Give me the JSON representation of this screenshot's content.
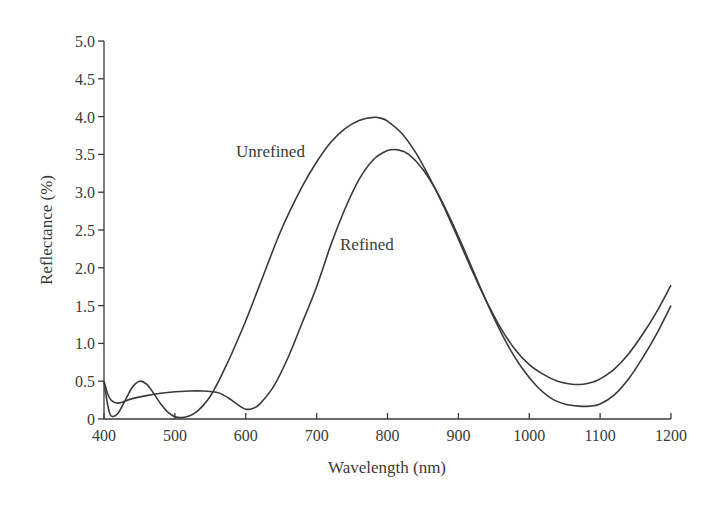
{
  "chart_data": {
    "type": "line",
    "title": "",
    "xlabel": "Wavelength (nm)",
    "ylabel": "Reflectance (%)",
    "xlim": [
      400,
      1200
    ],
    "ylim": [
      0,
      5.0
    ],
    "xticks": [
      400,
      500,
      600,
      700,
      800,
      900,
      1000,
      1100,
      1200
    ],
    "xtick_labels": [
      "400",
      "500",
      "600",
      "700",
      "800",
      "900",
      "1000",
      "1100",
      "1200"
    ],
    "yticks": [
      0,
      0.5,
      1.0,
      1.5,
      2.0,
      2.5,
      3.0,
      3.5,
      4.0,
      4.5,
      5.0
    ],
    "ytick_labels": [
      "0",
      "0.5",
      "1.0",
      "1.5",
      "2.0",
      "2.5",
      "3.0",
      "3.5",
      "4.0",
      "4.5",
      "5.0"
    ],
    "grid": false,
    "legend": "none (inline annotations)",
    "annotations": [
      {
        "text": "Unrefined",
        "series": "Unrefined"
      },
      {
        "text": "Refined",
        "series": "Refined"
      }
    ],
    "series": [
      {
        "name": "Unrefined",
        "x": [
          400,
          405,
          410,
          420,
          430,
          440,
          450,
          460,
          470,
          480,
          490,
          500,
          510,
          520,
          530,
          540,
          550,
          560,
          570,
          580,
          600,
          620,
          650,
          680,
          700,
          720,
          740,
          760,
          780,
          790,
          800,
          820,
          840,
          860,
          880,
          900,
          920,
          940,
          960,
          980,
          1000,
          1020,
          1040,
          1060,
          1076,
          1090,
          1100,
          1120,
          1140,
          1160,
          1180,
          1200
        ],
        "y": [
          0.5,
          0.2,
          0.04,
          0.08,
          0.25,
          0.42,
          0.5,
          0.46,
          0.34,
          0.2,
          0.09,
          0.03,
          0.02,
          0.04,
          0.09,
          0.18,
          0.3,
          0.47,
          0.66,
          0.86,
          1.3,
          1.78,
          2.5,
          3.08,
          3.4,
          3.66,
          3.84,
          3.95,
          3.99,
          3.98,
          3.94,
          3.78,
          3.52,
          3.18,
          2.8,
          2.38,
          1.95,
          1.55,
          1.2,
          0.92,
          0.72,
          0.59,
          0.5,
          0.46,
          0.46,
          0.49,
          0.53,
          0.66,
          0.86,
          1.12,
          1.42,
          1.77
        ]
      },
      {
        "name": "Refined",
        "x": [
          400,
          405,
          410,
          420,
          440,
          460,
          480,
          500,
          520,
          540,
          560,
          570,
          580,
          590,
          600,
          610,
          620,
          640,
          660,
          680,
          700,
          720,
          740,
          760,
          780,
          800,
          815,
          830,
          850,
          870,
          890,
          910,
          930,
          950,
          970,
          990,
          1010,
          1030,
          1050,
          1070,
          1085,
          1100,
          1120,
          1140,
          1160,
          1180,
          1200
        ],
        "y": [
          0.5,
          0.34,
          0.25,
          0.21,
          0.27,
          0.31,
          0.34,
          0.36,
          0.37,
          0.37,
          0.35,
          0.31,
          0.25,
          0.18,
          0.13,
          0.14,
          0.2,
          0.44,
          0.82,
          1.28,
          1.75,
          2.3,
          2.78,
          3.17,
          3.43,
          3.55,
          3.56,
          3.5,
          3.3,
          3.0,
          2.62,
          2.2,
          1.76,
          1.34,
          0.97,
          0.67,
          0.44,
          0.28,
          0.2,
          0.17,
          0.17,
          0.2,
          0.32,
          0.53,
          0.81,
          1.13,
          1.5
        ]
      }
    ]
  },
  "labels": {
    "unrefined": "Unrefined",
    "refined": "Refined",
    "xlabel": "Wavelength (nm)",
    "ylabel": "Reflectance (%)"
  }
}
